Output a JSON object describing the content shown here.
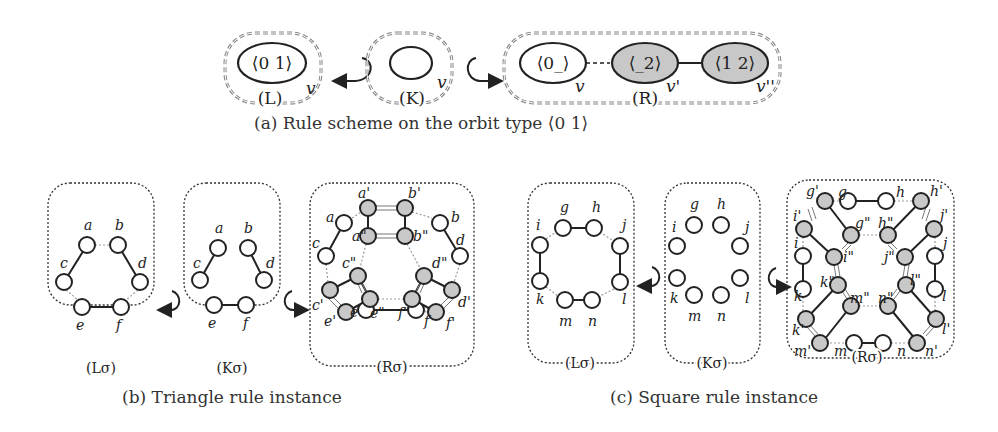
{
  "figure": {
    "panel_a": {
      "caption": "(a) Rule scheme on the orbit type ⟨0 1⟩",
      "L": {
        "label": "(L)",
        "node_label": "⟨0 1⟩",
        "var": "v"
      },
      "K": {
        "label": "(K)",
        "node_label": "",
        "var": "v"
      },
      "R": {
        "label": "(R)",
        "nodes": [
          {
            "label": "⟨0_⟩",
            "var": "v",
            "filled": false
          },
          {
            "label": "⟨_2⟩",
            "var": "v'",
            "filled": true
          },
          {
            "label": "⟨1 2⟩",
            "var": "v''",
            "filled": true
          }
        ]
      }
    },
    "panel_b": {
      "caption": "(b) Triangle rule instance",
      "L_label": "(Lσ)",
      "K_label": "(Kσ)",
      "R_label": "(Rσ)",
      "L_nodes": [
        "a",
        "b",
        "c",
        "d",
        "e",
        "f"
      ],
      "K_nodes": [
        "a",
        "b",
        "c",
        "d",
        "e",
        "f"
      ],
      "R_nodes": [
        "a",
        "a'",
        "a\"",
        "b",
        "b'",
        "b\"",
        "c",
        "c'",
        "c\"",
        "d",
        "d'",
        "d\"",
        "e",
        "e'",
        "e\"",
        "f",
        "f'",
        "f\""
      ]
    },
    "panel_c": {
      "caption": "(c) Square rule instance",
      "L_label": "(Lσ)",
      "K_label": "(Kσ)",
      "R_label": "(Rσ)",
      "L_nodes": [
        "g",
        "h",
        "i",
        "j",
        "k",
        "l",
        "m",
        "n"
      ],
      "K_nodes": [
        "g",
        "h",
        "i",
        "j",
        "k",
        "l",
        "m",
        "n"
      ],
      "R_nodes": [
        "g",
        "g'",
        "g\"",
        "h",
        "h'",
        "h\"",
        "i",
        "i'",
        "i\"",
        "j",
        "j'",
        "j\"",
        "k",
        "k'",
        "k\"",
        "l",
        "l'",
        "l\"",
        "m",
        "m'",
        "m\"",
        "n",
        "n'",
        "n\""
      ]
    },
    "colors": {
      "stroke": "#222222",
      "fill_new": "#c8c8c8",
      "fill_old": "#ffffff",
      "dash": "#888888"
    }
  }
}
